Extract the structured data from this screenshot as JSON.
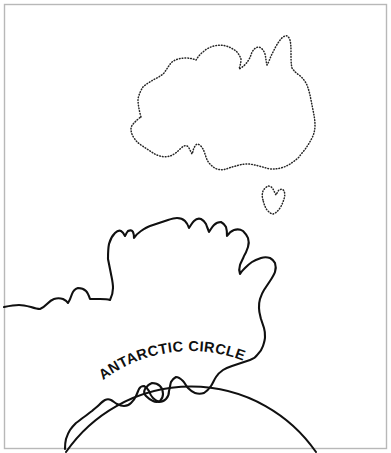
{
  "figure": {
    "kind": "line-map",
    "background_color": "#ffffff",
    "frame": {
      "name": "image-border",
      "color": "#b8b8b8",
      "inset_px": 4
    }
  },
  "labels": {
    "antarctic_circle": "ANTARCTIC CIRCLE",
    "antarctic_word": "ANTARCTIC",
    "circle_word": "CIRCLE"
  },
  "features": [
    {
      "name": "australia",
      "label": "Australia",
      "line_style": "dotted",
      "stroke_color": "#252525"
    },
    {
      "name": "tasmania",
      "label": "Tasmania",
      "line_style": "dotted",
      "stroke_color": "#252525"
    },
    {
      "name": "antarctica",
      "label": "Antarctica",
      "line_style": "solid",
      "stroke_color": "#101010"
    },
    {
      "name": "alexander-island",
      "label": "Alexander Island",
      "line_style": "solid",
      "stroke_color": "#101010"
    },
    {
      "name": "antarctic-circle-arc",
      "label": "Antarctic Circle",
      "line_style": "solid",
      "stroke_color": "#101010"
    }
  ],
  "geometry": {
    "australia_outline": "M 141 117 C 139 110 138 104 138 99 C 139 94 141 90 143 87 C 146 84 150 82 153 80 C 157 78 161 76 164 73 C 167 69 169 65 172 62 C 176 59 181 58 186 58 C 190 58 193 59 196 60 C 198 57 200 54 203 52 C 206 49 210 47 214 46 C 218 45 222 45 226 46 C 230 47 233 49 236 51 C 238 53 240 56 241 59 C 241 63 240 66 239 69 C 243 67 246 64 248 61 C 250 58 251 55 252 52 C 254 49 256 47 259 47 C 262 48 264 51 265 54 C 266 58 266 62 267 65 C 269 62 270 58 272 54 C 274 50 276 46 278 43 C 280 40 282 37 285 36 C 287 35 289 37 290 40 C 291 44 291 49 291 54 C 291 59 291 64 292 68 C 294 71 296 73 299 75 C 302 77 304 80 306 83 C 308 87 309 91 310 95 C 311 100 312 105 313 110 C 314 115 315 120 315 125 C 315 130 314 134 312 138 C 310 142 308 145 306 148 C 304 151 301 154 299 157 C 296 160 293 162 290 164 C 287 166 284 167 281 168 C 277 169 274 169 270 169 C 266 168 263 167 259 166 C 255 165 251 164 247 164 C 243 164 239 165 236 166 C 232 167 229 168 226 169 C 223 170 220 170 217 169 C 214 168 212 166 210 164 C 208 162 207 160 206 157 C 205 154 204 151 203 149 C 202 147 200 145 198 144 C 196 144 195 146 194 148 C 193 150 193 152 192 154 C 191 152 190 150 189 148 C 188 146 186 145 184 146 C 182 147 180 149 178 151 C 176 153 173 155 170 156 C 167 157 163 157 160 156 C 156 155 153 153 150 151 C 147 149 144 147 141 145 C 138 143 136 141 134 138 C 132 135 131 132 131 129 C 131 126 133 124 135 122 C 137 120 139 118 141 117 Z",
    "tasmania_outline": "M 263 200 C 262 197 262 194 263 191 C 264 189 266 187 268 186 C 270 186 272 187 273 189 C 274 191 275 193 276 195 C 277 193 278 191 279 190 C 281 189 283 189 284 191 C 285 193 285 196 284 199 C 283 202 282 205 280 208 C 278 211 276 213 273 214 C 271 214 269 212 267 210 C 265 207 264 204 263 200 Z",
    "antarctica_outline": "M 4 307 C 9 306 14 305 19 305 C 23 305 27 306 31 307 C 34 308 37 309 40 309 C 43 308 45 306 47 304 C 49 302 51 300 54 299 C 57 298 60 298 63 299 C 65 300 67 301 68 303 C 70 300 71 297 72 294 C 73 291 75 289 78 288 C 81 288 84 289 86 291 C 88 293 89 296 90 299 C 93 299 97 299 100 299 C 104 299 107 299 110 300 C 112 296 113 292 113 288 C 113 283 112 279 111 274 C 110 269 109 264 108 259 C 108 254 108 249 109 244 C 110 240 112 236 115 233 C 117 231 119 230 121 231 C 123 232 124 234 125 236 C 126 234 127 232 128 231 C 130 230 132 230 133 232 C 134 234 134 236 134 238 C 136 235 138 233 141 231 C 144 229 147 227 150 226 C 153 225 156 224 159 223 C 162 222 165 221 168 220 C 171 219 174 218 177 218 C 180 218 183 219 185 221 C 187 223 188 225 189 228 C 191 225 192 223 194 221 C 196 219 198 218 201 219 C 203 220 205 222 206 224 C 207 227 208 229 209 232 C 211 229 212 227 214 225 C 216 223 218 222 221 222 C 223 223 225 225 226 227 C 227 230 227 233 227 236 C 229 233 231 231 234 230 C 237 229 240 229 243 231 C 245 233 247 235 248 238 C 249 241 249 244 248 247 C 247 250 246 253 244 256 C 243 259 241 262 240 265 C 239 268 239 271 240 274 C 241 272 243 270 245 268 C 247 266 249 264 252 262 C 255 260 258 259 261 258 C 264 257 267 257 270 258 C 272 259 274 261 275 263 C 276 266 276 269 275 272 C 274 275 272 278 270 281 C 268 284 266 287 264 290 C 262 293 261 296 260 299 C 259 302 259 305 259 308 C 259 312 260 315 261 319 C 262 322 263 325 264 328 C 265 331 265 334 265 337 C 265 340 264 343 263 346 C 262 349 260 352 258 354 C 256 357 253 359 250 360 C 247 361 244 362 241 363 C 238 364 235 365 232 366 C 229 367 226 368 223 370 C 220 372 218 374 216 377 C 214 380 213 383 211 386 C 209 389 207 391 204 393 C 201 394 198 394 195 393 C 192 392 190 390 188 388 C 186 386 185 383 183 381 C 181 379 179 377 176 377 C 174 378 172 380 171 382 C 170 385 170 388 169 391 C 169 394 168 397 166 399 C 164 401 162 402 159 402 C 157 401 155 400 153 398 C 151 396 150 394 149 391 C 148 389 146 387 144 386 C 142 386 140 387 139 389 C 138 391 137 394 136 396 C 135 399 133 401 131 403 C 129 405 127 406 124 406 C 121 406 119 405 117 404 C 115 403 113 401 111 400 C 109 399 107 399 105 400 C 103 401 101 403 99 405 C 97 407 94 409 92 411 C 89 413 87 415 84 417 C 81 419 79 421 76 423 C 74 425 72 427 70 430 C 68 433 67 436 66 439 C 65 443 65 446 65 449",
    "alexander_island_outline": "M 145 389 C 147 386 149 384 152 383 C 155 383 158 384 160 386 C 162 388 163 391 163 394 C 163 397 162 399 160 401 C 158 402 155 402 153 401 C 150 400 148 398 146 396 C 144 394 144 391 145 389 Z",
    "antarctic_circle_arc": "M 66 452 A 152 152 0 0 1 316 452",
    "label_arc_path": "M 72 412 A 146 146 0 0 1 310 413"
  },
  "dimensions": {
    "width": 391,
    "height": 453
  }
}
